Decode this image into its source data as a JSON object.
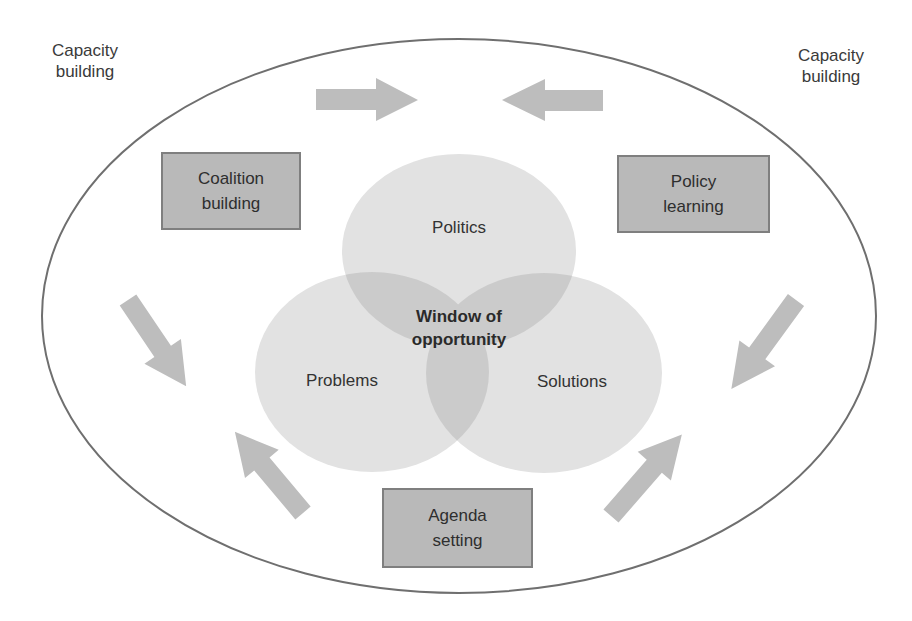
{
  "diagram": {
    "outer_ellipse": {
      "cx": 459,
      "cy": 316,
      "rx": 417,
      "ry": 277,
      "stroke": "#6f6f6f"
    },
    "corner_labels": {
      "top_left": {
        "line1": "Capacity",
        "line2": "building"
      },
      "top_right": {
        "line1": "Capacity",
        "line2": "building"
      }
    },
    "boxes": {
      "coalition": {
        "line1": "Coalition",
        "line2": "building"
      },
      "policy": {
        "line1": "Policy",
        "line2": "learning"
      },
      "agenda": {
        "line1": "Agenda",
        "line2": "setting"
      }
    },
    "venn": {
      "circles": [
        {
          "id": "politics",
          "label": "Politics",
          "cx": 459,
          "cy": 251,
          "rx": 117,
          "ry": 97
        },
        {
          "id": "problems",
          "label": "Problems",
          "cx": 372,
          "cy": 372,
          "rx": 117,
          "ry": 100
        },
        {
          "id": "solutions",
          "label": "Solutions",
          "cx": 544,
          "cy": 373,
          "rx": 118,
          "ry": 100
        }
      ],
      "center": {
        "line1": "Window of",
        "line2": "opportunity"
      },
      "fill": "#dcdcdc",
      "overlap_fill": "#c4c4c4"
    },
    "arrows": [
      {
        "id": "top-left",
        "direction": "right"
      },
      {
        "id": "top-right",
        "direction": "left"
      },
      {
        "id": "left-upper",
        "direction": "down-right"
      },
      {
        "id": "left-lower",
        "direction": "up-left"
      },
      {
        "id": "right-upper",
        "direction": "down-left"
      },
      {
        "id": "right-lower",
        "direction": "up-right"
      }
    ],
    "colors": {
      "arrow": "#bdbdbd",
      "box_fill": "#b9b9b9",
      "box_border": "#7f7f7f"
    }
  }
}
